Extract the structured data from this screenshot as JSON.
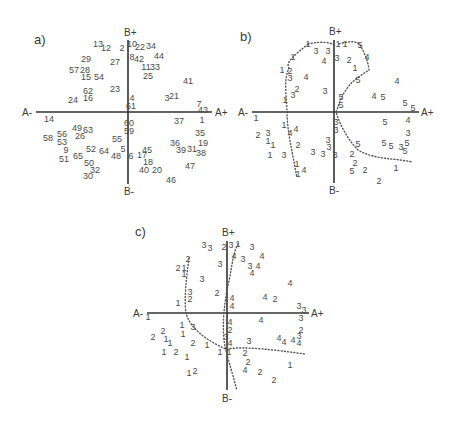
{
  "chart_data": [
    {
      "type": "scatter",
      "title": "a)",
      "axis_labels": {
        "a_minus": "A-",
        "a_plus": "A+",
        "b_plus": "B+",
        "b_minus": "B-"
      },
      "origin": [
        130,
        120
      ],
      "h_axis": [
        34,
        212
      ],
      "v_axis": [
        14,
        185
      ],
      "points": [
        {
          "t": "13",
          "x": 98,
          "y": 44,
          "s": "up"
        },
        {
          "t": "12",
          "x": 106,
          "y": 48
        },
        {
          "t": "2",
          "x": 122,
          "y": 48
        },
        {
          "t": "10",
          "x": 132,
          "y": 44,
          "s": "up"
        },
        {
          "t": "22",
          "x": 140,
          "y": 47
        },
        {
          "t": "34",
          "x": 151,
          "y": 46
        },
        {
          "t": "29",
          "x": 86,
          "y": 59
        },
        {
          "t": "27",
          "x": 115,
          "y": 62
        },
        {
          "t": "8",
          "x": 132,
          "y": 57
        },
        {
          "t": "42",
          "x": 139,
          "y": 59
        },
        {
          "t": "44",
          "x": 159,
          "y": 56
        },
        {
          "t": "57",
          "x": 74,
          "y": 70
        },
        {
          "t": "28",
          "x": 85,
          "y": 70
        },
        {
          "t": "11",
          "x": 146,
          "y": 67
        },
        {
          "t": "33",
          "x": 155,
          "y": 67
        },
        {
          "t": "15",
          "x": 86,
          "y": 77
        },
        {
          "t": "54",
          "x": 99,
          "y": 77
        },
        {
          "t": "25",
          "x": 148,
          "y": 76
        },
        {
          "t": "41",
          "x": 188,
          "y": 81
        },
        {
          "t": "62",
          "x": 88,
          "y": 91
        },
        {
          "t": "23",
          "x": 115,
          "y": 89
        },
        {
          "t": "24",
          "x": 73,
          "y": 100
        },
        {
          "t": "16",
          "x": 88,
          "y": 98
        },
        {
          "t": "4",
          "x": 132,
          "y": 98
        },
        {
          "t": "3",
          "x": 167,
          "y": 98
        },
        {
          "t": "21",
          "x": 174,
          "y": 96
        },
        {
          "t": "61",
          "x": 131,
          "y": 106
        },
        {
          "t": "7",
          "x": 199,
          "y": 104
        },
        {
          "t": "43",
          "x": 203,
          "y": 110
        },
        {
          "t": "14",
          "x": 49,
          "y": 119
        },
        {
          "t": "60",
          "x": 129,
          "y": 123
        },
        {
          "t": "37",
          "x": 179,
          "y": 121
        },
        {
          "t": "1",
          "x": 202,
          "y": 120
        },
        {
          "t": "49",
          "x": 77,
          "y": 128
        },
        {
          "t": "63",
          "x": 88,
          "y": 130
        },
        {
          "t": "56",
          "x": 62,
          "y": 134
        },
        {
          "t": "59",
          "x": 129,
          "y": 131
        },
        {
          "t": "35",
          "x": 200,
          "y": 133
        },
        {
          "t": "58",
          "x": 48,
          "y": 138
        },
        {
          "t": "53",
          "x": 62,
          "y": 142
        },
        {
          "t": "26",
          "x": 80,
          "y": 136
        },
        {
          "t": "55",
          "x": 117,
          "y": 139
        },
        {
          "t": "36",
          "x": 175,
          "y": 143
        },
        {
          "t": "19",
          "x": 203,
          "y": 143
        },
        {
          "t": "9",
          "x": 66,
          "y": 150
        },
        {
          "t": "52",
          "x": 91,
          "y": 149
        },
        {
          "t": "64",
          "x": 104,
          "y": 151
        },
        {
          "t": "5",
          "x": 123,
          "y": 149
        },
        {
          "t": "45",
          "x": 147,
          "y": 150
        },
        {
          "t": "39",
          "x": 181,
          "y": 150
        },
        {
          "t": "31",
          "x": 192,
          "y": 149
        },
        {
          "t": "38",
          "x": 201,
          "y": 153
        },
        {
          "t": "51",
          "x": 64,
          "y": 159
        },
        {
          "t": "65",
          "x": 78,
          "y": 156
        },
        {
          "t": "48",
          "x": 116,
          "y": 156
        },
        {
          "t": "6",
          "x": 131,
          "y": 156
        },
        {
          "t": "17",
          "x": 142,
          "y": 155
        },
        {
          "t": "50",
          "x": 89,
          "y": 163
        },
        {
          "t": "18",
          "x": 148,
          "y": 162
        },
        {
          "t": "47",
          "x": 190,
          "y": 166
        },
        {
          "t": "32",
          "x": 95,
          "y": 170
        },
        {
          "t": "40",
          "x": 144,
          "y": 170
        },
        {
          "t": "20",
          "x": 157,
          "y": 170
        },
        {
          "t": "30",
          "x": 88,
          "y": 176
        },
        {
          "t": "46",
          "x": 171,
          "y": 180
        }
      ]
    },
    {
      "type": "scatter",
      "title": "b)",
      "axis_labels": {
        "a_minus": "A-",
        "a_plus": "A+",
        "b_plus": "B+",
        "b_minus": "B-"
      },
      "origin": [
        334,
        112
      ],
      "h_axis": [
        252,
        419
      ],
      "v_axis": [
        15,
        183
      ],
      "points": [
        {
          "t": "1",
          "x": 308,
          "y": 44
        },
        {
          "t": "3",
          "x": 316,
          "y": 51
        },
        {
          "t": "3",
          "x": 328,
          "y": 51
        },
        {
          "t": "1",
          "x": 338,
          "y": 44
        },
        {
          "t": "1",
          "x": 345,
          "y": 44
        },
        {
          "t": "5",
          "x": 360,
          "y": 45
        },
        {
          "t": "1",
          "x": 293,
          "y": 57
        },
        {
          "t": "4",
          "x": 324,
          "y": 61
        },
        {
          "t": "3",
          "x": 337,
          "y": 58
        },
        {
          "t": "2",
          "x": 349,
          "y": 60
        },
        {
          "t": "4",
          "x": 367,
          "y": 57
        },
        {
          "t": "1",
          "x": 282,
          "y": 70
        },
        {
          "t": "2",
          "x": 290,
          "y": 71
        },
        {
          "t": "3",
          "x": 290,
          "y": 78
        },
        {
          "t": "4",
          "x": 306,
          "y": 77
        },
        {
          "t": "1",
          "x": 355,
          "y": 68
        },
        {
          "t": "5",
          "x": 358,
          "y": 80
        },
        {
          "t": "4",
          "x": 397,
          "y": 81
        },
        {
          "t": "2",
          "x": 297,
          "y": 89
        },
        {
          "t": "3",
          "x": 293,
          "y": 95
        },
        {
          "t": "1",
          "x": 285,
          "y": 100
        },
        {
          "t": "3",
          "x": 325,
          "y": 91
        },
        {
          "t": "5",
          "x": 341,
          "y": 97
        },
        {
          "t": "4",
          "x": 374,
          "y": 96
        },
        {
          "t": "5",
          "x": 383,
          "y": 97
        },
        {
          "t": "5",
          "x": 341,
          "y": 105
        },
        {
          "t": "5",
          "x": 405,
          "y": 103
        },
        {
          "t": "5",
          "x": 413,
          "y": 108
        },
        {
          "t": "1",
          "x": 256,
          "y": 118
        },
        {
          "t": "5",
          "x": 385,
          "y": 122
        },
        {
          "t": "4",
          "x": 408,
          "y": 120
        },
        {
          "t": "3",
          "x": 336,
          "y": 122
        },
        {
          "t": "3",
          "x": 336,
          "y": 130
        },
        {
          "t": "3",
          "x": 408,
          "y": 133
        },
        {
          "t": "1",
          "x": 284,
          "y": 125
        },
        {
          "t": "4",
          "x": 290,
          "y": 133
        },
        {
          "t": "4",
          "x": 296,
          "y": 129
        },
        {
          "t": "2",
          "x": 258,
          "y": 135
        },
        {
          "t": "3",
          "x": 268,
          "y": 133
        },
        {
          "t": "1",
          "x": 268,
          "y": 141
        },
        {
          "t": "1",
          "x": 273,
          "y": 145
        },
        {
          "t": "2",
          "x": 298,
          "y": 145
        },
        {
          "t": "3",
          "x": 328,
          "y": 140
        },
        {
          "t": "3",
          "x": 329,
          "y": 147
        },
        {
          "t": "5",
          "x": 358,
          "y": 144
        },
        {
          "t": "5",
          "x": 384,
          "y": 143
        },
        {
          "t": "5",
          "x": 391,
          "y": 146
        },
        {
          "t": "3",
          "x": 401,
          "y": 147
        },
        {
          "t": "5",
          "x": 407,
          "y": 143
        },
        {
          "t": "5",
          "x": 405,
          "y": 151
        },
        {
          "t": "1",
          "x": 270,
          "y": 155
        },
        {
          "t": "3",
          "x": 284,
          "y": 155
        },
        {
          "t": "3",
          "x": 313,
          "y": 152
        },
        {
          "t": "3",
          "x": 323,
          "y": 154
        },
        {
          "t": "3",
          "x": 335,
          "y": 155
        },
        {
          "t": "2",
          "x": 352,
          "y": 154
        },
        {
          "t": "1",
          "x": 297,
          "y": 164
        },
        {
          "t": "2",
          "x": 355,
          "y": 163
        },
        {
          "t": "5",
          "x": 352,
          "y": 171
        },
        {
          "t": "2",
          "x": 365,
          "y": 170
        },
        {
          "t": "1",
          "x": 396,
          "y": 168
        },
        {
          "t": "4",
          "x": 304,
          "y": 170
        },
        {
          "t": "1",
          "x": 298,
          "y": 174
        },
        {
          "t": "2",
          "x": 379,
          "y": 181
        }
      ],
      "boundaries": [
        "M 308 44 C 325 40 335 44 335 46",
        "M 308 44 C 295 55 285 62 289 68 C 283 80 287 100 287 112 C 287 130 292 150 297 178",
        "M 339 44 C 352 40 358 42 360 45 C 364 52 368 60 369 70 C 362 75 352 80 346 90 C 340 98 338 108 336 112 C 340 125 348 140 358 150 C 375 160 395 158 412 162"
      ]
    },
    {
      "type": "scatter",
      "title": "c)",
      "axis_labels": {
        "a_minus": "A-",
        "a_plus": "A+",
        "b_plus": "B+",
        "b_minus": "B-"
      },
      "origin": [
        227,
        313
      ],
      "h_axis": [
        145,
        309
      ],
      "v_axis": [
        240,
        390
      ],
      "points": [
        {
          "t": "3",
          "x": 204,
          "y": 245,
          "s": "up"
        },
        {
          "t": "3",
          "x": 210,
          "y": 248
        },
        {
          "t": "2",
          "x": 224,
          "y": 247
        },
        {
          "t": "3",
          "x": 231,
          "y": 245
        },
        {
          "t": "1",
          "x": 238,
          "y": 244
        },
        {
          "t": "3",
          "x": 252,
          "y": 247
        },
        {
          "t": "2",
          "x": 188,
          "y": 259
        },
        {
          "t": "4",
          "x": 234,
          "y": 256
        },
        {
          "t": "3",
          "x": 243,
          "y": 259
        },
        {
          "t": "4",
          "x": 262,
          "y": 256
        },
        {
          "t": "2",
          "x": 178,
          "y": 268
        },
        {
          "t": "1",
          "x": 184,
          "y": 268
        },
        {
          "t": "3",
          "x": 220,
          "y": 264
        },
        {
          "t": "3",
          "x": 250,
          "y": 266
        },
        {
          "t": "4",
          "x": 258,
          "y": 266
        },
        {
          "t": "1",
          "x": 184,
          "y": 274
        },
        {
          "t": "3",
          "x": 202,
          "y": 279
        },
        {
          "t": "4",
          "x": 252,
          "y": 273
        },
        {
          "t": "4",
          "x": 290,
          "y": 283
        },
        {
          "t": "3",
          "x": 190,
          "y": 292
        },
        {
          "t": "2",
          "x": 190,
          "y": 299
        },
        {
          "t": "1",
          "x": 178,
          "y": 303
        },
        {
          "t": "2",
          "x": 217,
          "y": 293
        },
        {
          "t": "4",
          "x": 232,
          "y": 298
        },
        {
          "t": "4",
          "x": 265,
          "y": 297
        },
        {
          "t": "2",
          "x": 275,
          "y": 299
        },
        {
          "t": "4",
          "x": 232,
          "y": 306
        },
        {
          "t": "3",
          "x": 299,
          "y": 306
        },
        {
          "t": "3",
          "x": 304,
          "y": 310
        },
        {
          "t": "1",
          "x": 148,
          "y": 317
        },
        {
          "t": "4",
          "x": 261,
          "y": 320
        },
        {
          "t": "3",
          "x": 301,
          "y": 318
        },
        {
          "t": "4",
          "x": 230,
          "y": 322
        },
        {
          "t": "2",
          "x": 230,
          "y": 330
        },
        {
          "t": "1",
          "x": 182,
          "y": 325
        },
        {
          "t": "3",
          "x": 193,
          "y": 327
        },
        {
          "t": "2",
          "x": 301,
          "y": 330
        },
        {
          "t": "2",
          "x": 163,
          "y": 331
        },
        {
          "t": "2",
          "x": 153,
          "y": 337
        },
        {
          "t": "1",
          "x": 166,
          "y": 339
        },
        {
          "t": "1",
          "x": 170,
          "y": 343
        },
        {
          "t": "1",
          "x": 183,
          "y": 334
        },
        {
          "t": "3",
          "x": 226,
          "y": 337
        },
        {
          "t": "4",
          "x": 230,
          "y": 343
        },
        {
          "t": "4",
          "x": 279,
          "y": 338
        },
        {
          "t": "4",
          "x": 284,
          "y": 342
        },
        {
          "t": "4",
          "x": 293,
          "y": 340
        },
        {
          "t": "3",
          "x": 299,
          "y": 336
        },
        {
          "t": "4",
          "x": 299,
          "y": 343
        },
        {
          "t": "2",
          "x": 193,
          "y": 343
        },
        {
          "t": "3",
          "x": 249,
          "y": 341
        },
        {
          "t": "1",
          "x": 207,
          "y": 345
        },
        {
          "t": "1",
          "x": 164,
          "y": 352
        },
        {
          "t": "2",
          "x": 176,
          "y": 352
        },
        {
          "t": "1",
          "x": 187,
          "y": 357
        },
        {
          "t": "1",
          "x": 220,
          "y": 352
        },
        {
          "t": "1",
          "x": 229,
          "y": 352
        },
        {
          "t": "2",
          "x": 245,
          "y": 353
        },
        {
          "t": "1",
          "x": 290,
          "y": 365
        },
        {
          "t": "2",
          "x": 248,
          "y": 362
        },
        {
          "t": "4",
          "x": 245,
          "y": 370
        },
        {
          "t": "2",
          "x": 260,
          "y": 372
        },
        {
          "t": "2",
          "x": 274,
          "y": 380
        },
        {
          "t": "1",
          "x": 189,
          "y": 373
        },
        {
          "t": "2",
          "x": 195,
          "y": 371
        }
      ],
      "boundaries": [
        "M 189 258 C 186 280 184 300 186 313 C 190 328 205 340 228 350",
        "M 238 244 C 232 255 232 270 228 285 C 225 300 222 320 224 340 C 226 355 232 370 237 391",
        "M 227 349 C 245 346 275 350 305 354"
      ]
    }
  ]
}
